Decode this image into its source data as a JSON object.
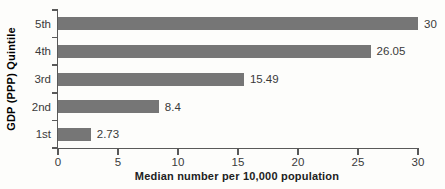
{
  "figure": {
    "background_color": "#fdfdfb",
    "bar_color": "#767676",
    "axis_color": "#595959",
    "text_color": "#3a3a3a"
  },
  "chart_data": {
    "type": "bar",
    "orientation": "horizontal",
    "categories": [
      "5th",
      "4th",
      "3rd",
      "2nd",
      "1st"
    ],
    "values": [
      30,
      26.05,
      15.49,
      8.4,
      2.73
    ],
    "value_labels": [
      "30",
      "26.05",
      "15.49",
      "8.4",
      "2.73"
    ],
    "title": "",
    "xlabel": "Median number per 10,000 population",
    "ylabel": "GDP (PPP) Quintile",
    "xlim": [
      0,
      30
    ],
    "x_ticks": [
      0,
      5,
      10,
      15,
      20,
      25,
      30
    ],
    "grid": false,
    "legend": null
  }
}
